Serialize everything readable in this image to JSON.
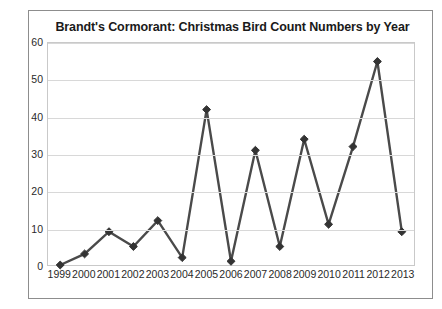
{
  "chart_data": {
    "type": "line",
    "title": "Brandt's Cormorant: Christmas Bird Count Numbers by Year",
    "xlabel": "",
    "ylabel": "",
    "categories": [
      "1999",
      "2000",
      "2001",
      "2002",
      "2003",
      "2004",
      "2005",
      "2006",
      "2007",
      "2008",
      "2009",
      "2010",
      "2011",
      "2012",
      "2013"
    ],
    "values": [
      0,
      3,
      9,
      5,
      12,
      2,
      42,
      1,
      31,
      5,
      34,
      11,
      32,
      55,
      9
    ],
    "series": [
      {
        "name": "Christmas Bird Count",
        "values": [
          0,
          3,
          9,
          5,
          12,
          2,
          42,
          1,
          31,
          5,
          34,
          11,
          32,
          55,
          9
        ]
      }
    ],
    "ylim": [
      0,
      60
    ],
    "yticks": [
      0,
      10,
      20,
      30,
      40,
      50,
      60
    ],
    "xtick_labels": [
      "1999",
      "2000",
      "2001",
      "2002",
      "2003",
      "2004",
      "2005",
      "2006",
      "2007",
      "2008",
      "2009",
      "2010",
      "2011",
      "2012",
      "2013"
    ],
    "grid": true,
    "grid_axis": "y",
    "legend": false,
    "legend_position": "none",
    "marker": "diamond",
    "line_color": "#4a4a4a",
    "marker_color": "#333333",
    "grid_color": "#d8d8d8",
    "plot_border_color": "#c9c9c9",
    "outer_border_color": "#8d8d8d",
    "background_color": "#ffffff",
    "title_color": "#1a1a1a"
  }
}
